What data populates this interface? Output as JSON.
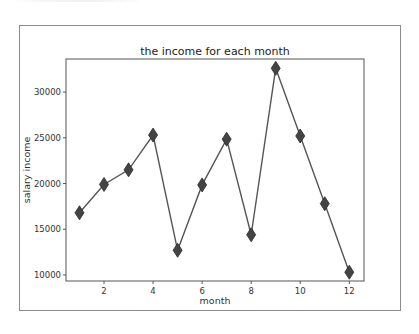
{
  "chart_data": {
    "type": "line",
    "title": "the income for each month",
    "xlabel": "month",
    "ylabel": "salary income",
    "x": [
      1,
      2,
      3,
      4,
      5,
      6,
      7,
      8,
      9,
      10,
      11,
      12
    ],
    "series": [
      {
        "name": "salary income",
        "values": [
          16800,
          19900,
          21500,
          25300,
          12700,
          19850,
          24850,
          14400,
          32600,
          25200,
          17800,
          10300
        ],
        "marker": "diamond",
        "line_color": "#555555",
        "marker_color": "#444444"
      }
    ],
    "xticks": [
      2,
      4,
      6,
      8,
      10,
      12
    ],
    "yticks": [
      10000,
      15000,
      20000,
      25000,
      30000
    ],
    "xlim": [
      0.45,
      12.6
    ],
    "ylim": [
      9340,
      33620
    ],
    "grid": false,
    "legend": null
  },
  "labels": {
    "title": "the income for each month",
    "xlabel": "month",
    "ylabel": "salary income",
    "xticks": [
      "2",
      "4",
      "6",
      "8",
      "10",
      "12"
    ],
    "yticks": [
      "10000",
      "15000",
      "20000",
      "25000",
      "30000"
    ]
  }
}
